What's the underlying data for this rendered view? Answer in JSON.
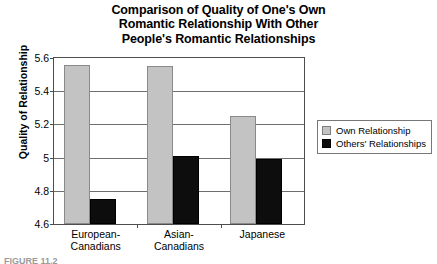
{
  "chart_data": {
    "type": "bar",
    "title": "Comparison of Quality of One's Own Romantic Relationship With Other People's Romantic Relationships",
    "title_lines": [
      "Comparison of Quality of One's Own",
      "Romantic Relationship With Other",
      "People's Romantic Relationships"
    ],
    "xlabel": "",
    "ylabel": "Quality of Relationship",
    "categories": [
      "European-Canadians",
      "Asian-Canadians",
      "Japanese"
    ],
    "category_lines": [
      [
        "European-",
        "Canadians"
      ],
      [
        "Asian-",
        "Canadians"
      ],
      [
        "Japanese"
      ]
    ],
    "series": [
      {
        "name": "Own Relationship",
        "color": "#c3c3c3",
        "values": [
          5.56,
          5.55,
          5.25
        ]
      },
      {
        "name": "Others' Relationships",
        "color": "#0d0d0d",
        "values": [
          4.75,
          5.01,
          4.99
        ]
      }
    ],
    "ylim": [
      4.6,
      5.6
    ],
    "yticks": [
      4.6,
      4.8,
      5.0,
      5.2,
      5.4,
      5.6
    ],
    "ytick_labels": [
      "4.6",
      "4.8",
      "5",
      "5.2",
      "5.4",
      "5.6"
    ],
    "grid": true,
    "legend_position": "right"
  },
  "caption": "FIGURE 11.2"
}
